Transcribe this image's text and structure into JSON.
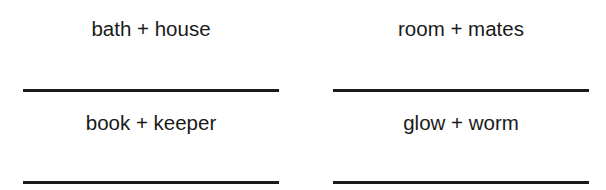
{
  "worksheet": {
    "items": [
      {
        "prompt": "bath + house",
        "answer": ""
      },
      {
        "prompt": "room + mates",
        "answer": ""
      },
      {
        "prompt": "book + keeper",
        "answer": ""
      },
      {
        "prompt": "glow + worm",
        "answer": ""
      }
    ],
    "colors": {
      "text": "#1a1a1a",
      "line": "#1a1a1a",
      "background": "#ffffff"
    }
  }
}
